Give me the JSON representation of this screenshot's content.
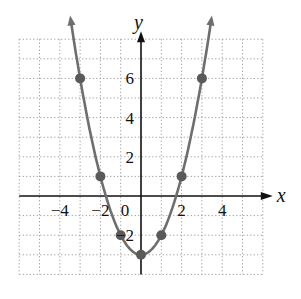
{
  "chart_data": {
    "type": "line",
    "title": "",
    "function": "y = x^2 - 3",
    "xlabel": "x",
    "ylabel": "y",
    "xlim": [
      -6,
      6
    ],
    "ylim": [
      -4,
      8
    ],
    "grid": true,
    "x_ticks": [
      {
        "value": -4,
        "label": "−4"
      },
      {
        "value": -2,
        "label": "−2"
      },
      {
        "value": 0,
        "label": "0"
      },
      {
        "value": 2,
        "label": "2"
      },
      {
        "value": 4,
        "label": "4"
      }
    ],
    "y_ticks": [
      {
        "value": 6,
        "label": "6"
      },
      {
        "value": 4,
        "label": "4"
      },
      {
        "value": 2,
        "label": "2"
      },
      {
        "value": -2,
        "label": "−2"
      }
    ],
    "points": [
      {
        "x": -3,
        "y": 6
      },
      {
        "x": -2,
        "y": 1
      },
      {
        "x": -1,
        "y": -2
      },
      {
        "x": 0,
        "y": -3
      },
      {
        "x": 1,
        "y": -2
      },
      {
        "x": 2,
        "y": 1
      },
      {
        "x": 3,
        "y": 6
      }
    ],
    "colors": {
      "curve": "#6e6e6e",
      "point": "#5a5a5a",
      "axis": "#111111",
      "grid": "#9a9a9a"
    }
  }
}
